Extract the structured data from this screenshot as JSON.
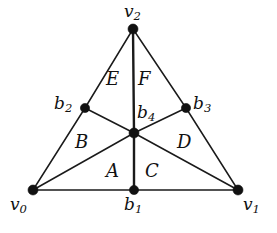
{
  "figure": {
    "kind": "geometric-diagram",
    "background_color": "#ffffff",
    "line_color": "#1a1a1a",
    "vertex_color": "#111111",
    "width": 277,
    "height": 233
  },
  "vertices": [
    {
      "id": "v0",
      "base": "v",
      "sub": "0",
      "x": 33,
      "y": 190,
      "label_x": 10,
      "label_y": 196,
      "dot_r": 5.0
    },
    {
      "id": "v1",
      "base": "v",
      "sub": "1",
      "x": 238,
      "y": 190,
      "label_x": 243,
      "label_y": 196,
      "dot_r": 5.0
    },
    {
      "id": "v2",
      "base": "v",
      "sub": "2",
      "x": 133,
      "y": 29,
      "label_x": 124,
      "label_y": 3,
      "dot_r": 5.0
    },
    {
      "id": "b1",
      "base": "b",
      "sub": "1",
      "x": 134,
      "y": 190,
      "label_x": 124,
      "label_y": 196,
      "dot_r": 4.6
    },
    {
      "id": "b2",
      "base": "b",
      "sub": "2",
      "x": 85,
      "y": 108,
      "label_x": 54,
      "label_y": 95,
      "dot_r": 4.6
    },
    {
      "id": "b3",
      "base": "b",
      "sub": "3",
      "x": 186,
      "y": 108,
      "label_x": 193,
      "label_y": 95,
      "dot_r": 4.6
    },
    {
      "id": "b4",
      "base": "b",
      "sub": "4",
      "x": 134,
      "y": 133,
      "label_x": 137,
      "label_y": 104,
      "dot_r": 5.0
    }
  ],
  "edges": [
    {
      "id": "v0-b2",
      "from": "v0",
      "to": "b2",
      "weight": "thin"
    },
    {
      "id": "b2-v2",
      "from": "b2",
      "to": "v2",
      "weight": "thin"
    },
    {
      "id": "v2-b3",
      "from": "v2",
      "to": "b3",
      "weight": "thin"
    },
    {
      "id": "b3-v1",
      "from": "b3",
      "to": "v1",
      "weight": "thin"
    },
    {
      "id": "v0-b1",
      "from": "v0",
      "to": "b1",
      "weight": "thin"
    },
    {
      "id": "b1-v1",
      "from": "b1",
      "to": "v1",
      "weight": "thin"
    },
    {
      "id": "v2-b4",
      "from": "v2",
      "to": "b4",
      "weight": "thick"
    },
    {
      "id": "b4-b1",
      "from": "b4",
      "to": "b1",
      "weight": "thick"
    },
    {
      "id": "b2-b4",
      "from": "b2",
      "to": "b4",
      "weight": "thin"
    },
    {
      "id": "b4-b3",
      "from": "b4",
      "to": "b3",
      "weight": "thin"
    },
    {
      "id": "v0-b4",
      "from": "v0",
      "to": "b4",
      "weight": "thin"
    },
    {
      "id": "b4-v1",
      "from": "b4",
      "to": "v1",
      "weight": "thin"
    }
  ],
  "regions": [
    {
      "id": "A",
      "label": "A",
      "x": 106,
      "y": 162
    },
    {
      "id": "B",
      "label": "B",
      "x": 75,
      "y": 133
    },
    {
      "id": "C",
      "label": "C",
      "x": 145,
      "y": 162
    },
    {
      "id": "D",
      "label": "D",
      "x": 177,
      "y": 133
    },
    {
      "id": "E",
      "label": "E",
      "x": 106,
      "y": 70
    },
    {
      "id": "F",
      "label": "F",
      "x": 138,
      "y": 70
    }
  ]
}
